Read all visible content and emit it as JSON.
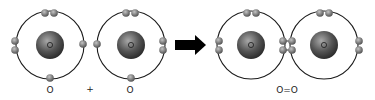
{
  "diagram": {
    "type": "bohr-model-covalent-bond",
    "colors": {
      "orbit": "#1a1a1a",
      "nucleus_light": "#9a9a9a",
      "nucleus_dark": "#2e2e2e",
      "electron_light": "#b8b8b8",
      "electron_dark": "#4a4a4a",
      "arrow": "#000000",
      "text": "#222222"
    },
    "reactants": [
      {
        "id": "atom-1",
        "nucleus_symbol": "O",
        "cx": 50,
        "cy": 45,
        "r": 34,
        "electrons": [
          [
            45,
            13
          ],
          [
            54,
            13
          ],
          [
            15,
            41
          ],
          [
            15,
            50
          ],
          [
            83,
            44
          ],
          [
            50,
            78
          ]
        ]
      },
      {
        "id": "atom-2",
        "nucleus_symbol": "O",
        "cx": 131,
        "cy": 45,
        "r": 34,
        "electrons": [
          [
            126,
            13
          ],
          [
            135,
            13
          ],
          [
            97,
            44
          ],
          [
            163,
            41
          ],
          [
            163,
            50
          ],
          [
            131,
            78
          ]
        ]
      }
    ],
    "product": {
      "atoms": [
        {
          "id": "atom-3",
          "nucleus_symbol": "O",
          "cx": 251,
          "cy": 45,
          "r": 34,
          "electrons": [
            [
              247,
              13
            ],
            [
              256,
              13
            ],
            [
              219,
              41
            ],
            [
              219,
              50
            ]
          ]
        },
        {
          "id": "atom-4",
          "nucleus_symbol": "O",
          "cx": 324,
          "cy": 45,
          "r": 34,
          "electrons": [
            [
              320,
              13
            ],
            [
              329,
              13
            ],
            [
              359,
              41
            ],
            [
              359,
              50
            ]
          ]
        }
      ],
      "shared_electrons": [
        [
          283,
          41
        ],
        [
          292,
          41
        ],
        [
          283,
          50
        ],
        [
          292,
          50
        ]
      ]
    },
    "labels": {
      "reactant_1": "O",
      "plus": "+",
      "reactant_2": "O",
      "product": "O=O"
    },
    "label_positions": {
      "reactant_1": [
        50,
        90
      ],
      "plus": [
        90,
        89
      ],
      "reactant_2": [
        130,
        90
      ],
      "product": [
        287,
        90
      ]
    },
    "arrow": {
      "x1": 175,
      "x2": 206,
      "y": 45
    }
  }
}
